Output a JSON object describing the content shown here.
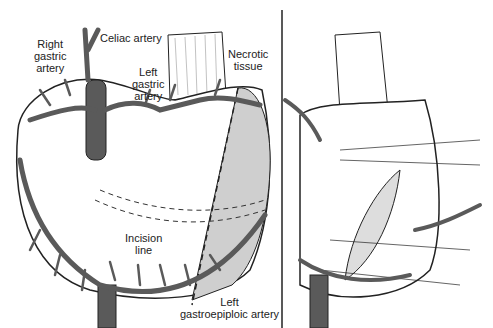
{
  "labels": {
    "right_gastric_artery": [
      "Right",
      "gastric",
      "artery"
    ],
    "celiac_artery": "Celiac artery",
    "left_gastric_artery": [
      "Left",
      "gastric",
      "artery"
    ],
    "necrotic_tissue": [
      "Necrotic",
      "tissue"
    ],
    "incision_line": [
      "Incision",
      "line"
    ],
    "left_gastroepiploic_artery": [
      "Left",
      "gastroepiploic artery"
    ]
  },
  "colors": {
    "vessel_fill": "#5a5a5a",
    "outline": "#222222",
    "necrotic_fill": "#cfcfcf",
    "background": "#ffffff"
  }
}
